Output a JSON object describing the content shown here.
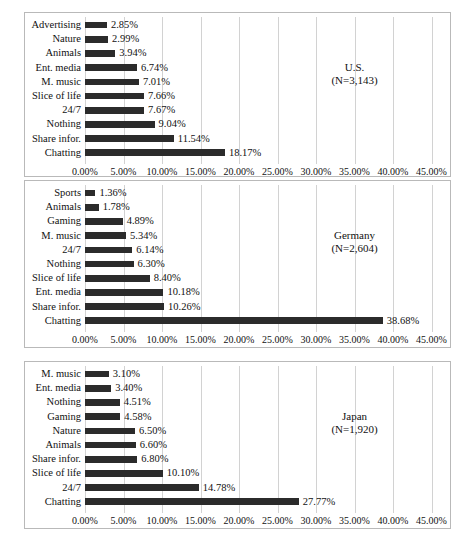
{
  "figure": {
    "background": "#ffffff",
    "bar_color": "#2b2b2b",
    "grid_color": "#d2d2d2",
    "border_color": "#b9b9b9"
  },
  "axis": {
    "ticks": [
      "0.00%",
      "5.00%",
      "10.00%",
      "15.00%",
      "20.00%",
      "25.00%",
      "30.00%",
      "35.00%",
      "40.00%",
      "45.00%"
    ],
    "tick_values": [
      0,
      5,
      10,
      15,
      20,
      25,
      30,
      35,
      40,
      45
    ],
    "min": 0,
    "max": 45
  },
  "chart_data": [
    {
      "type": "bar",
      "orientation": "horizontal",
      "title": "U.S.",
      "subtitle": "(N=3,143)",
      "sample_size": "3,143",
      "xlabel": "",
      "ylabel": "",
      "xlim": [
        0,
        45
      ],
      "grid": true,
      "legend": "none",
      "categories": [
        "Advertising",
        "Nature",
        "Animals",
        "Ent. media",
        "M. music",
        "Slice of life",
        "24/7",
        "Nothing",
        "Share infor.",
        "Chatting"
      ],
      "values": [
        2.85,
        2.99,
        3.94,
        6.74,
        7.01,
        7.66,
        7.67,
        9.04,
        11.54,
        18.17
      ],
      "labels": [
        "2.85%",
        "2.99%",
        "3.94%",
        "6.74%",
        "7.01%",
        "7.66%",
        "7.67%",
        "9.04%",
        "11.54%",
        "18.17%"
      ]
    },
    {
      "type": "bar",
      "orientation": "horizontal",
      "title": "Germany",
      "subtitle": "(N=2,604)",
      "sample_size": "2,604",
      "xlabel": "",
      "ylabel": "",
      "xlim": [
        0,
        45
      ],
      "grid": true,
      "legend": "none",
      "categories": [
        "Sports",
        "Animals",
        "Gaming",
        "M. music",
        "24/7",
        "Nothing",
        "Slice of life",
        "Ent. media",
        "Share infor.",
        "Chatting"
      ],
      "values": [
        1.36,
        1.78,
        4.89,
        5.34,
        6.14,
        6.3,
        8.4,
        10.18,
        10.26,
        38.68
      ],
      "labels": [
        "1.36%",
        "1.78%",
        "4.89%",
        "5.34%",
        "6.14%",
        "6.30%",
        "8.40%",
        "10.18%",
        "10.26%",
        "38.68%"
      ]
    },
    {
      "type": "bar",
      "orientation": "horizontal",
      "title": "Japan",
      "subtitle": "(N=1,920)",
      "sample_size": "1,920",
      "xlabel": "",
      "ylabel": "",
      "xlim": [
        0,
        45
      ],
      "grid": true,
      "legend": "none",
      "categories": [
        "M. music",
        "Ent. media",
        "Nothing",
        "Gaming",
        "Nature",
        "Animals",
        "Share infor.",
        "Slice of life",
        "24/7",
        "Chatting"
      ],
      "values": [
        3.1,
        3.4,
        4.51,
        4.58,
        6.5,
        6.6,
        6.8,
        10.1,
        14.78,
        27.77
      ],
      "labels": [
        "3.10%",
        "3.40%",
        "4.51%",
        "4.58%",
        "6.50%",
        "6.60%",
        "6.80%",
        "10.10%",
        "14.78%",
        "27.77%"
      ]
    }
  ]
}
